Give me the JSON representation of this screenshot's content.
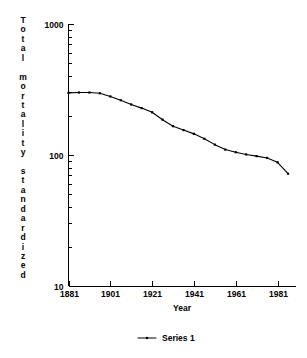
{
  "chart_data": {
    "type": "line",
    "title": "",
    "xlabel": "Year",
    "ylabel": "Total mortality standardized",
    "yscale": "log",
    "ylim": [
      10,
      1000
    ],
    "xlim": [
      1881,
      1986
    ],
    "grid": false,
    "legend_position": "bottom",
    "y_ticks": [
      10,
      100,
      1000
    ],
    "y_tick_labels": [
      "10",
      "100",
      "1000"
    ],
    "x_ticks": [
      1881,
      1901,
      1921,
      1941,
      1961,
      1981
    ],
    "x_tick_labels": [
      "1881",
      "1901",
      "1921",
      "1941",
      "1961",
      "1981"
    ],
    "series": [
      {
        "name": "Series 1",
        "color": "#000000",
        "marker": "dot",
        "x": [
          1881,
          1886,
          1891,
          1896,
          1901,
          1906,
          1911,
          1916,
          1921,
          1926,
          1931,
          1936,
          1941,
          1946,
          1951,
          1956,
          1961,
          1966,
          1971,
          1976,
          1981,
          1986
        ],
        "values": [
          298,
          300,
          300,
          296,
          280,
          262,
          243,
          228,
          212,
          186,
          166,
          155,
          145,
          133,
          120,
          110,
          105,
          101,
          98,
          95,
          88,
          72
        ]
      }
    ],
    "legend": [
      {
        "label": "Series 1",
        "color": "#000000"
      }
    ]
  },
  "axes": {
    "y_title_chars": [
      "T",
      "o",
      "t",
      "a",
      "l",
      "",
      "m",
      "o",
      "r",
      "t",
      "a",
      "l",
      "i",
      "t",
      "y",
      "",
      "s",
      "t",
      "a",
      "n",
      "d",
      "a",
      "r",
      "d",
      "i",
      "z",
      "e",
      "d"
    ],
    "x_title": "Year"
  }
}
